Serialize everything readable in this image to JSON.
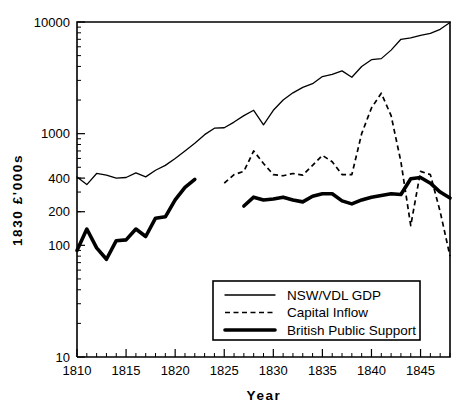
{
  "chart_data": {
    "type": "line",
    "title": "",
    "xlabel": "Year",
    "ylabel": "1830 £'000s",
    "yscale": "log",
    "ylim": [
      10,
      10000
    ],
    "xlim": [
      1810,
      1848
    ],
    "grid": false,
    "legend_position": "bottom-right",
    "ytick_labels": [
      "10000",
      "1000",
      "400",
      "200",
      "100",
      "10"
    ],
    "ytick_values": [
      10000,
      1000,
      400,
      200,
      100,
      10
    ],
    "xtick_labels": [
      "1810",
      "1815",
      "1820",
      "1825",
      "1830",
      "1835",
      "1840",
      "1845"
    ],
    "xtick_values": [
      1810,
      1815,
      1820,
      1825,
      1830,
      1835,
      1840,
      1845
    ],
    "series": [
      {
        "name": "NSW/VDL GDP",
        "style": "thin-solid",
        "x": [
          1810,
          1811,
          1812,
          1813,
          1814,
          1815,
          1816,
          1817,
          1818,
          1819,
          1820,
          1821,
          1822,
          1823,
          1824,
          1825,
          1826,
          1827,
          1828,
          1829,
          1830,
          1831,
          1832,
          1833,
          1834,
          1835,
          1836,
          1837,
          1838,
          1839,
          1840,
          1841,
          1842,
          1843,
          1844,
          1845,
          1846,
          1847,
          1848
        ],
        "y": [
          410,
          350,
          440,
          425,
          400,
          405,
          445,
          410,
          470,
          520,
          600,
          700,
          820,
          980,
          1120,
          1130,
          1270,
          1450,
          1620,
          1200,
          1620,
          2000,
          2320,
          2600,
          2800,
          3250,
          3400,
          3650,
          3200,
          4000,
          4600,
          4700,
          5600,
          7000,
          7200,
          7600,
          7900,
          8600,
          9900
        ]
      },
      {
        "name": "Capital Inflow",
        "style": "dashed",
        "x": [
          1825,
          1826,
          1827,
          1828,
          1829,
          1830,
          1831,
          1832,
          1833,
          1834,
          1835,
          1836,
          1837,
          1838,
          1839,
          1840,
          1841,
          1842,
          1843,
          1844,
          1845,
          1846,
          1847,
          1848
        ],
        "y": [
          360,
          430,
          460,
          700,
          540,
          430,
          420,
          440,
          425,
          520,
          640,
          560,
          430,
          430,
          1000,
          1700,
          2300,
          1450,
          560,
          150,
          460,
          430,
          200,
          80
        ]
      },
      {
        "name": "British Public Support",
        "style": "thick-solid",
        "x": [
          1810,
          1811,
          1812,
          1813,
          1814,
          1815,
          1816,
          1817,
          1818,
          1819,
          1820,
          1821,
          1822
        ],
        "y": [
          90,
          140,
          95,
          75,
          110,
          112,
          140,
          120,
          175,
          180,
          255,
          330,
          390
        ]
      },
      {
        "name": "British Public Support",
        "style": "thick-solid",
        "x": [
          1827,
          1828,
          1829,
          1830,
          1831,
          1832,
          1833,
          1834,
          1835,
          1836,
          1837,
          1838,
          1839,
          1840,
          1841,
          1842,
          1843,
          1844,
          1845,
          1846,
          1847,
          1848
        ],
        "y": [
          225,
          270,
          255,
          260,
          270,
          255,
          245,
          275,
          290,
          290,
          250,
          235,
          255,
          270,
          280,
          290,
          285,
          395,
          405,
          360,
          300,
          265
        ]
      }
    ]
  },
  "legend": {
    "items": [
      {
        "label": "NSW/VDL GDP",
        "style": "thin-solid"
      },
      {
        "label": "Capital Inflow",
        "style": "dashed"
      },
      {
        "label": "British Public Support",
        "style": "thick-solid"
      }
    ]
  }
}
